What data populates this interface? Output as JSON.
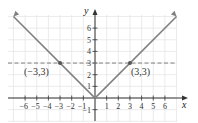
{
  "chart_data": {
    "type": "line",
    "title": "",
    "xlabel": "x",
    "ylabel": "y",
    "xlim": [
      -7.3,
      7.3
    ],
    "ylim": [
      -2,
      7.3
    ],
    "grid": true,
    "x_ticks": [
      -6,
      -5,
      -4,
      -3,
      -2,
      -1,
      1,
      2,
      3,
      4,
      5,
      6
    ],
    "x_tick_labels": [
      "−6",
      "−5",
      "−4",
      "−3",
      "−2",
      "−1",
      "1",
      "2",
      "3",
      "4",
      "5",
      "6"
    ],
    "y_ticks": [
      -1,
      1,
      2,
      3,
      4,
      5,
      6
    ],
    "y_tick_labels": [
      "−1",
      "1",
      "2",
      "3",
      "4",
      "5",
      "6"
    ],
    "series": [
      {
        "name": "y = |x|",
        "style": "solid",
        "color": "#808080",
        "x": [
          -7,
          -6,
          -5,
          -4,
          -3,
          -2,
          -1,
          0,
          1,
          2,
          3,
          4,
          5,
          6,
          7
        ],
        "y": [
          7,
          6,
          5,
          4,
          3,
          2,
          1,
          0,
          1,
          2,
          3,
          4,
          5,
          6,
          7
        ]
      },
      {
        "name": "y = 3",
        "style": "dashed",
        "color": "#808080",
        "x": [
          -7.3,
          7
        ],
        "y": [
          3,
          3
        ]
      }
    ],
    "points": [
      {
        "x": -3,
        "y": 3,
        "label": "(−3,3)"
      },
      {
        "x": 3,
        "y": 3,
        "label": "(3,3)"
      }
    ],
    "annotations": [
      "(−3,3)",
      "(3,3)"
    ]
  },
  "labels": {
    "x_axis": "x",
    "y_axis": "y",
    "point_left": "(−3,3)",
    "point_right": "(3,3)"
  },
  "colors": {
    "line": "#808080",
    "axis": "#333333",
    "grid": "#e6e6e6",
    "point": "#555555"
  }
}
